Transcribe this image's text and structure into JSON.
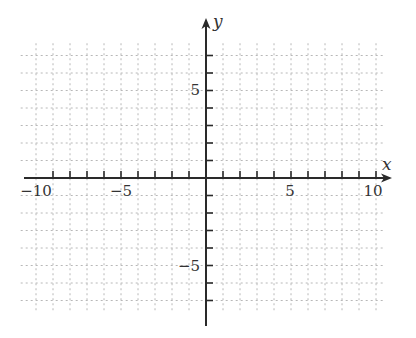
{
  "figure": {
    "type": "coordinate-plane",
    "x_axis": {
      "label": "x",
      "min": -10,
      "max": 10,
      "tick_step": 1,
      "labeled_ticks": [
        -10,
        -5,
        5,
        10
      ]
    },
    "y_axis": {
      "label": "y",
      "min": -7,
      "max": 7,
      "tick_step": 1,
      "labeled_ticks": [
        5,
        -5
      ]
    },
    "grid": {
      "style": "dotted",
      "step": 1,
      "color": "#b8b8b8"
    },
    "axis_color": "#2a2a2a"
  },
  "labels": {
    "x_axis_name": "x",
    "y_axis_name": "y",
    "x_neg10": "−10",
    "x_neg5": "−5",
    "x_5": "5",
    "x_10": "10",
    "y_5": "5",
    "y_neg5": "−5"
  }
}
